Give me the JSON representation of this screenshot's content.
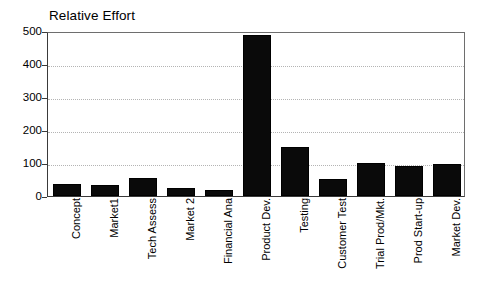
{
  "chart_data": {
    "type": "bar",
    "title": "Relative Effort",
    "xlabel": "",
    "ylabel": "",
    "categories": [
      "Concept",
      "Market1",
      "Tech Assess",
      "Market 2",
      "Financial Ana",
      "Product Dev.",
      "Testing",
      "Customer Test",
      "Trial Prod/Mkt.",
      "Prod Start-up",
      "Market Dev."
    ],
    "values": [
      35,
      32,
      55,
      23,
      18,
      487,
      148,
      52,
      100,
      90,
      98
    ],
    "ylim": [
      0,
      500
    ],
    "yticks": [
      0,
      100,
      200,
      300,
      400,
      500
    ],
    "ytick_labels": [
      "0",
      "100",
      "200",
      "300",
      "400",
      "500"
    ],
    "grid": true,
    "grid_style": "dotted-horizontal",
    "legend": "none",
    "bar_color": "#0a0a0a",
    "axis_color": "#3a3a3a",
    "grid_color": "#b4b4b4",
    "background_color": "#ffffff"
  }
}
